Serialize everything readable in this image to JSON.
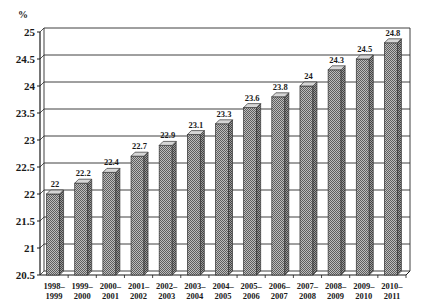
{
  "chart_data": {
    "type": "bar",
    "title": "",
    "xlabel": "",
    "ylabel": "%",
    "ylim": [
      20.5,
      25
    ],
    "yticks": [
      20.5,
      21,
      21.5,
      22,
      22.5,
      23,
      23.5,
      24,
      24.5,
      25
    ],
    "ytick_labels": [
      "20.5",
      "21",
      "21.5",
      "22",
      "22.5",
      "23",
      "23.5",
      "24",
      "24.5",
      "25"
    ],
    "grid": true,
    "legend": null,
    "style": "3d-column, hatched grey fill",
    "categories": [
      [
        "1998–",
        "1999"
      ],
      [
        "1999–",
        "2000"
      ],
      [
        "2000–",
        "2001"
      ],
      [
        "2001–",
        "2002"
      ],
      [
        "2002–",
        "2003"
      ],
      [
        "2003–",
        "2004"
      ],
      [
        "2004–",
        "2005"
      ],
      [
        "2005–",
        "2006"
      ],
      [
        "2006–",
        "2007"
      ],
      [
        "2007–",
        "2008"
      ],
      [
        "2008–",
        "2009"
      ],
      [
        "2009–",
        "2010"
      ],
      [
        "2010–",
        "2011"
      ]
    ],
    "values": [
      22,
      22.2,
      22.4,
      22.7,
      22.9,
      23.1,
      23.3,
      23.6,
      23.8,
      24,
      24.3,
      24.5,
      24.8
    ],
    "value_labels": [
      "22",
      "22.2",
      "22.4",
      "22.7",
      "22.9",
      "23.1",
      "23.3",
      "23.6",
      "23.8",
      "24",
      "24.3",
      "24.5",
      "24.8"
    ]
  },
  "colors": {
    "bar_fill": "#a8a8a8",
    "bar_pattern_dark": "#6e6e6e",
    "bar_side": "#8c8c8c",
    "bar_top": "#d6d6d6",
    "grid": "#2a2a2a",
    "axis": "#1a1a1a",
    "text": "#1a1a1a"
  }
}
